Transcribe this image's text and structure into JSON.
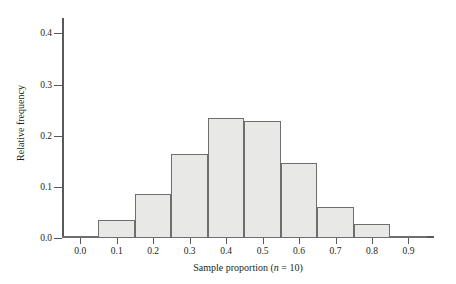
{
  "chart_data": {
    "type": "bar",
    "title": "",
    "subtitle": "",
    "xlabel_parts": {
      "prefix": "Sample proportion (",
      "italic": "n",
      "suffix": " = 10)"
    },
    "xlabel": "Sample proportion (n = 10)",
    "ylabel": "Relative frequency",
    "xlim": [
      -0.05,
      0.97
    ],
    "ylim": [
      0.0,
      0.43
    ],
    "grid": false,
    "legend": null,
    "x_tick_labels": [
      "0.0",
      "0.1",
      "0.2",
      "0.3",
      "0.4",
      "0.5",
      "0.6",
      "0.7",
      "0.8",
      "0.9"
    ],
    "x_tick_values": [
      0.0,
      0.1,
      0.2,
      0.3,
      0.4,
      0.5,
      0.6,
      0.7,
      0.8,
      0.9
    ],
    "y_tick_labels": [
      "0.0",
      "0.1",
      "0.2",
      "0.3",
      "0.4"
    ],
    "y_tick_values": [
      0.0,
      0.1,
      0.2,
      0.3,
      0.4
    ],
    "bin_width": 0.1,
    "bin_edges": [
      -0.05,
      0.05,
      0.15,
      0.25,
      0.35,
      0.45,
      0.55,
      0.65,
      0.75,
      0.85,
      0.95
    ],
    "categories": [
      "0.0",
      "0.1",
      "0.2",
      "0.3",
      "0.4",
      "0.5",
      "0.6",
      "0.7",
      "0.8",
      "0.9"
    ],
    "values": [
      0.002,
      0.035,
      0.087,
      0.164,
      0.234,
      0.229,
      0.146,
      0.06,
      0.028,
      0.004
    ],
    "bars": [
      {
        "center": 0.0,
        "left": -0.05,
        "right": 0.05,
        "value": 0.002
      },
      {
        "center": 0.1,
        "left": 0.05,
        "right": 0.15,
        "value": 0.035
      },
      {
        "center": 0.2,
        "left": 0.15,
        "right": 0.25,
        "value": 0.087
      },
      {
        "center": 0.3,
        "left": 0.25,
        "right": 0.35,
        "value": 0.164
      },
      {
        "center": 0.4,
        "left": 0.35,
        "right": 0.45,
        "value": 0.234
      },
      {
        "center": 0.5,
        "left": 0.45,
        "right": 0.55,
        "value": 0.229
      },
      {
        "center": 0.6,
        "left": 0.55,
        "right": 0.65,
        "value": 0.146
      },
      {
        "center": 0.7,
        "left": 0.65,
        "right": 0.75,
        "value": 0.06
      },
      {
        "center": 0.8,
        "left": 0.75,
        "right": 0.85,
        "value": 0.028
      },
      {
        "center": 0.9,
        "left": 0.85,
        "right": 0.95,
        "value": 0.004
      }
    ],
    "colors": {
      "bar_fill": "#e8e8e7",
      "bar_stroke": "#6d6e70",
      "axis": "#58595b",
      "text": "#231f20",
      "background": "#ffffff"
    }
  }
}
